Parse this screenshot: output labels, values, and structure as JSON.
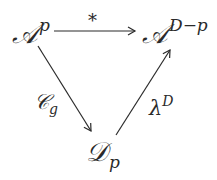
{
  "diagram": {
    "type": "commutative-triangle",
    "nodes": {
      "top_left": {
        "base": "𝒜",
        "sup": "p",
        "sub": ""
      },
      "top_right": {
        "base": "𝒜",
        "sup": "D−p",
        "sub": ""
      },
      "bottom": {
        "base": "𝒟",
        "sup": "",
        "sub": "p"
      }
    },
    "arrows": {
      "horizontal": {
        "from": "top_left",
        "to": "top_right",
        "label": "*"
      },
      "left_diagonal": {
        "from": "top_left",
        "to": "bottom",
        "label_base": "𝒞",
        "label_sub": "g"
      },
      "right_diagonal": {
        "from": "bottom",
        "to": "top_right",
        "label_base": "λ",
        "label_sup": "D"
      }
    },
    "colors": {
      "ink": "#2a2a2a",
      "background": "#ffffff"
    }
  }
}
